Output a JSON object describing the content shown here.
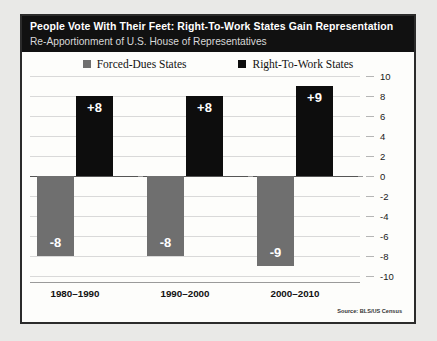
{
  "header": {
    "title": "People Vote With Their Feet: Right-To-Work States Gain Representation",
    "subtitle": "Re-Apportionment of U.S. House of Representatives"
  },
  "legend": {
    "items": [
      {
        "label": "Forced-Dues States",
        "color": "#6f6f6f",
        "icon": "square-swatch"
      },
      {
        "label": "Right-To-Work States",
        "color": "#0d0d0d",
        "icon": "square-swatch"
      }
    ]
  },
  "source_note": "Source: BLS/US Census",
  "chart_data": {
    "type": "bar",
    "title": "People Vote With Their Feet: Right-To-Work States Gain Representation",
    "subtitle": "Re-Apportionment of U.S. House of Representatives",
    "xlabel": "",
    "ylabel": "",
    "ylim": [
      -10,
      10
    ],
    "grid": true,
    "legend_position": "top-center",
    "y_axis_position": "right",
    "yticks": [
      10,
      8,
      6,
      4,
      2,
      0,
      -2,
      -4,
      -6,
      -8,
      -10
    ],
    "ytick_labels": [
      "10",
      "8",
      "6",
      "4",
      "2",
      "0",
      "-2",
      "-4",
      "-6",
      "-8",
      "-10"
    ],
    "categories": [
      "1980–1990",
      "1990–2000",
      "2000–2010"
    ],
    "series": [
      {
        "name": "Forced-Dues States",
        "color": "#6f6f6f",
        "values": [
          -8,
          -8,
          -9
        ],
        "data_labels": [
          "-8",
          "-8",
          "-9"
        ]
      },
      {
        "name": "Right-To-Work States",
        "color": "#0d0d0d",
        "values": [
          8,
          8,
          9
        ],
        "data_labels": [
          "+8",
          "+8",
          "+9"
        ]
      }
    ]
  }
}
